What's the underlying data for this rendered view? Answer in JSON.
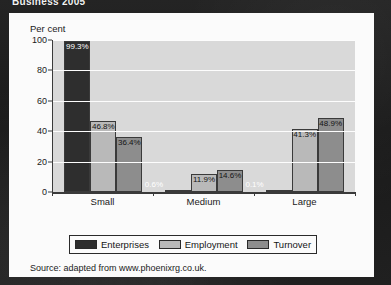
{
  "document": {
    "title": "Business 2005"
  },
  "card": {
    "source_note": "Source: adapted from www.phoenixrg.co.uk."
  },
  "colors": {
    "enterprises": "#2e2e2e",
    "employment": "#b9b9b9",
    "turnover": "#8d8d8d",
    "plot_background": "#d9d9d9",
    "gridline": "#fdfdfd",
    "axis": "#3a3a3a",
    "card_background": "#fbfbfb",
    "page_background": "#1c1c1c"
  },
  "chart_data": {
    "type": "bar",
    "title": "Business 2005",
    "xlabel": "",
    "ylabel": "Per cent",
    "ylim": [
      0,
      100
    ],
    "yticks": [
      0,
      20,
      40,
      60,
      80,
      100
    ],
    "ytick_labels": [
      "0",
      "20",
      "40",
      "60",
      "80",
      "100"
    ],
    "grid": true,
    "legend_position": "bottom",
    "categories": [
      "Small",
      "Medium",
      "Large"
    ],
    "series": [
      {
        "name": "Enterprises",
        "color": "#2e2e2e",
        "values": [
          99.3,
          0.6,
          0.1
        ],
        "labels": [
          "99.3%",
          "0.6%",
          "0.1%"
        ]
      },
      {
        "name": "Employment",
        "color": "#b9b9b9",
        "values": [
          46.8,
          11.9,
          41.3
        ],
        "labels": [
          "46.8%",
          "11.9%",
          "41.3%"
        ]
      },
      {
        "name": "Turnover",
        "color": "#8d8d8d",
        "values": [
          36.4,
          14.6,
          48.9
        ],
        "labels": [
          "36.4%",
          "14.6%",
          "48.9%"
        ]
      }
    ]
  }
}
